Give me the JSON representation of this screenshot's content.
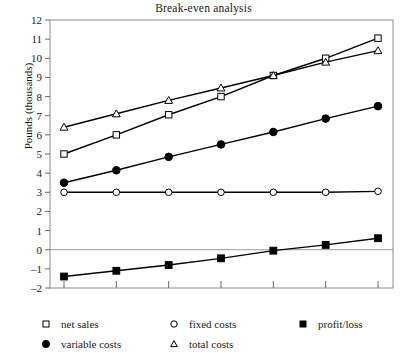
{
  "chart": {
    "title": "Break-even analysis",
    "ylabel": "Pounds (thousands)",
    "xlabel": ""
  },
  "axis": {
    "y_ticks": [
      "12",
      "11",
      "10",
      "9",
      "8",
      "7",
      "6",
      "5",
      "4",
      "3",
      "2",
      "1",
      "0",
      "–1",
      "–2"
    ]
  },
  "legend": {
    "net_sales": "net sales",
    "fixed_costs": "fixed costs",
    "profit_loss": "profit/loss",
    "variable_costs": "variable costs",
    "total_costs": "total costs"
  },
  "chart_data": {
    "type": "line",
    "title": "Break-even analysis",
    "xlabel": "",
    "ylabel": "Pounds (thousands)",
    "ylim": [
      -2,
      12
    ],
    "ytick_values": [
      -2,
      -1,
      0,
      1,
      2,
      3,
      4,
      5,
      6,
      7,
      8,
      9,
      10,
      11,
      12
    ],
    "x": [
      1,
      2,
      3,
      4,
      5,
      6,
      7
    ],
    "xtick_labels": [
      "",
      "",
      "",
      "",
      "",
      "",
      ""
    ],
    "grid": false,
    "zero_reference_line": 0,
    "legend_position": "below-axes",
    "series": [
      {
        "name": "net sales",
        "marker": "open-square",
        "color": "#000000",
        "values": [
          5.0,
          6.0,
          7.05,
          8.0,
          9.1,
          10.0,
          11.05
        ]
      },
      {
        "name": "total costs",
        "marker": "open-triangle",
        "color": "#000000",
        "values": [
          6.4,
          7.1,
          7.8,
          8.45,
          9.1,
          9.8,
          10.4
        ]
      },
      {
        "name": "variable costs",
        "marker": "filled-circle",
        "color": "#000000",
        "values": [
          3.5,
          4.15,
          4.85,
          5.5,
          6.15,
          6.85,
          7.5
        ]
      },
      {
        "name": "fixed costs",
        "marker": "open-circle",
        "color": "#000000",
        "values": [
          3.0,
          3.0,
          3.0,
          3.0,
          3.0,
          3.0,
          3.05
        ]
      },
      {
        "name": "profit/loss",
        "marker": "filled-square",
        "color": "#000000",
        "values": [
          -1.4,
          -1.1,
          -0.8,
          -0.45,
          -0.05,
          0.25,
          0.6
        ]
      }
    ]
  }
}
